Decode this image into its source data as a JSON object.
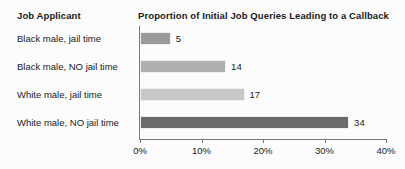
{
  "header": {
    "category_column_title": "Job Applicant",
    "chart_title": "Proportion of Initial Job Queries Leading to a Callback"
  },
  "chart_data": {
    "type": "bar",
    "orientation": "horizontal",
    "title": "Proportion of Initial Job Queries Leading to a Callback",
    "xlabel": "",
    "ylabel": "Job Applicant",
    "categories": [
      "Black male, jail time",
      "Black male, NO jail time",
      "White male, jail time",
      "White male, NO jail time"
    ],
    "values": [
      5,
      14,
      17,
      34
    ],
    "value_labels": [
      "5",
      "14",
      "17",
      "34"
    ],
    "bar_colors": [
      "#9a9a9a",
      "#b0b0b0",
      "#c8c8c8",
      "#6b6b6b"
    ],
    "xlim": [
      0,
      40
    ],
    "xticks": [
      0,
      10,
      20,
      30,
      40
    ],
    "xtick_labels": [
      "0%",
      "10%",
      "20%",
      "30%",
      "40%"
    ],
    "grid": false,
    "legend": false,
    "unit": "percent"
  },
  "style": {
    "background": "#fcfcfc",
    "axis_color": "#7a7a7a",
    "text_color": "#1a1a1a"
  }
}
